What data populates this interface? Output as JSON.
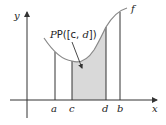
{
  "diagram": {
    "colors": {
      "stroke": "#333333",
      "curve": "#888888",
      "shade": "#d9d9d9",
      "background": "#ffffff"
    },
    "axes": {
      "x_label": "x",
      "y_label": "y"
    },
    "function_label": "f",
    "region_label_prefix": "P([c, ",
    "region_label_d": "d",
    "region_label_suffix": "])",
    "x_marks": [
      {
        "id": "a",
        "label": "a"
      },
      {
        "id": "c",
        "label": "c"
      },
      {
        "id": "d",
        "label": "d"
      },
      {
        "id": "b",
        "label": "b"
      }
    ]
  }
}
